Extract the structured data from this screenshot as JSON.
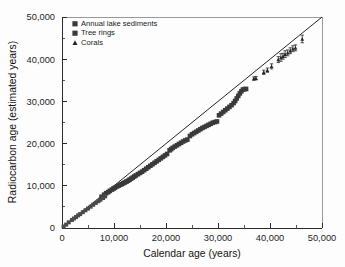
{
  "chart_data": {
    "type": "scatter",
    "title": "",
    "xlabel": "Calendar age (years)",
    "ylabel": "Radiocarbon age (estimated years)",
    "xlim": [
      0,
      50000
    ],
    "ylim": [
      0,
      50000
    ],
    "grid": false,
    "legend_position": "upper-left-inside",
    "xticks": [
      0,
      10000,
      20000,
      30000,
      40000,
      50000
    ],
    "xticklabels": [
      "0",
      "10,000",
      "20,000",
      "30,000",
      "40,000",
      "50,000"
    ],
    "yticks": [
      0,
      10000,
      20000,
      30000,
      40000,
      50000
    ],
    "yticklabels": [
      "0",
      "10,000",
      "20,000",
      "30,000",
      "40,000",
      "50,000"
    ],
    "minor_tick_interval": 5000,
    "annotations": [
      {
        "name": "one-to-one-line",
        "label": "1:1 reference line",
        "from": [
          0,
          0
        ],
        "to": [
          50000,
          50000
        ]
      }
    ],
    "series": [
      {
        "name": "Annual lake sediments",
        "marker": "square",
        "color": "#3a3a3a",
        "points": [
          [
            7600,
            7400
          ],
          [
            8100,
            7900
          ],
          [
            8500,
            8250
          ],
          [
            8900,
            8500
          ],
          [
            9200,
            8800
          ],
          [
            9600,
            9100
          ],
          [
            9900,
            9350
          ],
          [
            10200,
            9550
          ],
          [
            10600,
            9850
          ],
          [
            10900,
            10050
          ],
          [
            11200,
            10250
          ],
          [
            11500,
            10400
          ],
          [
            11800,
            10600
          ],
          [
            12100,
            10800
          ],
          [
            12400,
            11000
          ],
          [
            12700,
            11200
          ],
          [
            13000,
            11450
          ],
          [
            13300,
            11700
          ],
          [
            13600,
            11950
          ],
          [
            13900,
            12200
          ],
          [
            14200,
            12450
          ],
          [
            14600,
            12750
          ],
          [
            15000,
            13050
          ],
          [
            15400,
            13350
          ],
          [
            15800,
            13700
          ],
          [
            16200,
            14050
          ],
          [
            16600,
            14400
          ],
          [
            17000,
            14750
          ],
          [
            17400,
            15100
          ],
          [
            17800,
            15450
          ],
          [
            18200,
            15800
          ],
          [
            18600,
            16150
          ],
          [
            19000,
            16500
          ],
          [
            19400,
            16850
          ],
          [
            19800,
            17200
          ],
          [
            20200,
            17550
          ],
          [
            20700,
            18400
          ],
          [
            21000,
            18700
          ],
          [
            21300,
            19000
          ],
          [
            21700,
            19300
          ],
          [
            22100,
            19600
          ],
          [
            22500,
            19900
          ],
          [
            22900,
            20200
          ],
          [
            23300,
            20500
          ],
          [
            23700,
            20750
          ],
          [
            24100,
            20950
          ],
          [
            24600,
            21800
          ],
          [
            25000,
            22200
          ],
          [
            25400,
            22500
          ],
          [
            25800,
            22800
          ],
          [
            26200,
            23100
          ],
          [
            26600,
            23400
          ],
          [
            27000,
            23700
          ],
          [
            27400,
            23950
          ],
          [
            27800,
            24200
          ],
          [
            28200,
            24450
          ],
          [
            28600,
            24700
          ],
          [
            29000,
            24950
          ],
          [
            29400,
            25100
          ],
          [
            29800,
            25250
          ],
          [
            30200,
            26700
          ],
          [
            30600,
            27100
          ],
          [
            31000,
            27500
          ],
          [
            31400,
            27900
          ],
          [
            31800,
            28300
          ],
          [
            32200,
            28700
          ],
          [
            32600,
            29100
          ],
          [
            33000,
            29600
          ],
          [
            33300,
            30100
          ],
          [
            33600,
            30700
          ],
          [
            33900,
            31300
          ],
          [
            34200,
            31900
          ],
          [
            34500,
            32400
          ],
          [
            34800,
            32800
          ],
          [
            35100,
            32900
          ],
          [
            35400,
            32950
          ]
        ]
      },
      {
        "name": "Tree rings",
        "marker": "square",
        "color": "#4a4a4a",
        "points": [
          [
            300,
            350
          ],
          [
            800,
            800
          ],
          [
            1300,
            1350
          ],
          [
            1900,
            1900
          ],
          [
            2300,
            2250
          ],
          [
            2700,
            2600
          ],
          [
            3100,
            3000
          ],
          [
            3500,
            3300
          ],
          [
            4000,
            3750
          ],
          [
            4500,
            4200
          ],
          [
            5000,
            4600
          ],
          [
            5500,
            5050
          ],
          [
            6000,
            5500
          ],
          [
            6500,
            5950
          ],
          [
            7000,
            6350
          ],
          [
            7400,
            6700
          ],
          [
            7900,
            7100
          ],
          [
            8300,
            7500
          ]
        ]
      },
      {
        "name": "Corals",
        "marker": "triangle",
        "color": "#242424",
        "points": [
          [
            36900,
            35400
          ],
          [
            37300,
            35500
          ],
          [
            38800,
            36900
          ],
          [
            39500,
            37400
          ],
          [
            40300,
            38300
          ],
          [
            41600,
            39900
          ],
          [
            42100,
            40400
          ],
          [
            42500,
            40700
          ],
          [
            42900,
            41200
          ],
          [
            43400,
            41500
          ],
          [
            43900,
            42000
          ],
          [
            44400,
            42500
          ],
          [
            44900,
            42700
          ],
          [
            46200,
            44800
          ]
        ],
        "yerr": [
          400,
          400,
          500,
          500,
          600,
          700,
          900,
          700,
          800,
          700,
          700,
          700,
          700,
          900
        ]
      }
    ],
    "legend_entries": [
      {
        "label": "Annual lake sediments",
        "marker": "square",
        "color": "#3a3a3a"
      },
      {
        "label": "Tree rings",
        "marker": "square",
        "color": "#4a4a4a"
      },
      {
        "label": "Corals",
        "marker": "triangle",
        "color": "#242424"
      }
    ]
  }
}
